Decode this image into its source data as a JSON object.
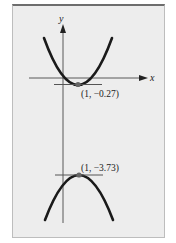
{
  "figure": {
    "axes": {
      "x_label": "x",
      "y_label": "y"
    },
    "points": [
      {
        "label": "(1, −0.27)",
        "x": 1,
        "y": -0.27,
        "curve": "upper parabola (opens upward)",
        "tangent": "horizontal"
      },
      {
        "label": "(1, −3.73)",
        "x": 1,
        "y": -3.73,
        "curve": "lower parabola (opens downward)",
        "tangent": "horizontal"
      }
    ],
    "colors": {
      "panel": "#ededed",
      "curve": "#1a1a1a",
      "axis": "#333333",
      "tangent": "#555555",
      "point": "#666666",
      "border_top": "#6d6d6d"
    }
  }
}
